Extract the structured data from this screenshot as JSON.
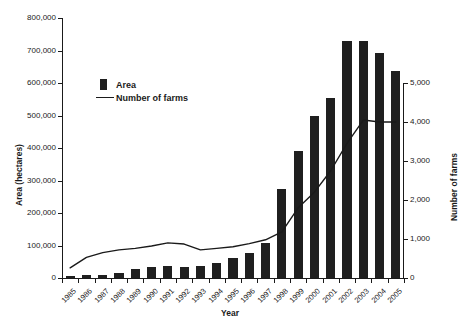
{
  "chart_data": {
    "type": "bar",
    "title": "",
    "subtitle": "",
    "xlabel": "Year",
    "ylabel": "Area (hectares)",
    "y2label": "Number of farms",
    "grid": false,
    "legend_position": "upper-left-inside",
    "ylim": [
      0,
      800000
    ],
    "y2lim": [
      0,
      5000
    ],
    "yticks": [
      "0",
      "100,000",
      "200,000",
      "300,000",
      "400,000",
      "500,000",
      "600,000",
      "700,000",
      "800,000"
    ],
    "ytick_values": [
      0,
      100000,
      200000,
      300000,
      400000,
      500000,
      600000,
      700000,
      800000
    ],
    "y2ticks": [
      "0",
      "1,000",
      "2,000",
      "3,000",
      "4,000",
      "5,000"
    ],
    "y2tick_values": [
      0,
      1000,
      2000,
      3000,
      4000,
      5000
    ],
    "categories": [
      "1985",
      "1986",
      "1987",
      "1988",
      "1989",
      "1990",
      "1991",
      "1992",
      "1993",
      "1994",
      "1995",
      "1996",
      "1997",
      "1998",
      "1999",
      "2000",
      "2001",
      "2002",
      "2003",
      "2004",
      "2005"
    ],
    "series": [
      {
        "name": "Area",
        "type": "bar",
        "axis": "left",
        "unit": "hectares",
        "color": "#1f1f1f",
        "values": [
          6000,
          9000,
          10000,
          16000,
          27000,
          33000,
          36000,
          33000,
          37000,
          45000,
          62000,
          78000,
          108000,
          275000,
          390000,
          500000,
          553000,
          730000,
          730000,
          692000,
          637000
        ]
      },
      {
        "name": "Number of farms",
        "type": "line",
        "axis": "right",
        "unit": "farms",
        "color": "#1a1a1a",
        "values": [
          260,
          530,
          650,
          720,
          760,
          820,
          900,
          870,
          720,
          760,
          800,
          880,
          980,
          1180,
          1800,
          2200,
          2750,
          3450,
          4050,
          4000,
          4000
        ]
      }
    ]
  },
  "legend": {
    "items": [
      {
        "label": "Area",
        "marker": "square-swatch"
      },
      {
        "label": "Number of farms",
        "marker": "line-swatch"
      }
    ]
  }
}
